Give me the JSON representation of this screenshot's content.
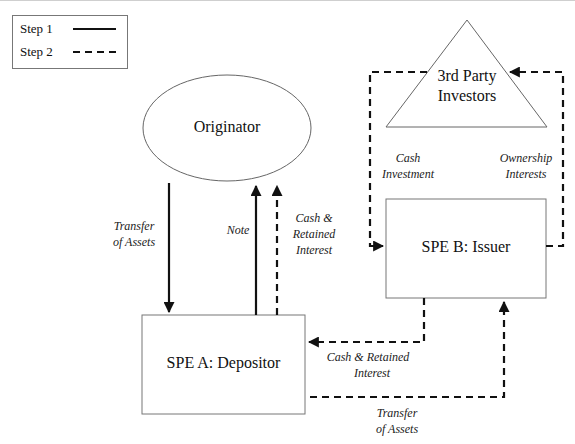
{
  "legend": {
    "items": [
      {
        "label": "Step 1",
        "style": "solid"
      },
      {
        "label": "Step 2",
        "style": "dashed"
      }
    ]
  },
  "nodes": {
    "originator": "Originator",
    "investors_line1": "3rd Party",
    "investors_line2": "Investors",
    "spe_a": "SPE A: Depositor",
    "spe_b": "SPE B: Issuer"
  },
  "flows": {
    "transfer_assets_1": {
      "line1": "Transfer",
      "line2": "of Assets",
      "step": 1
    },
    "note": {
      "line1": "Note",
      "step": 1
    },
    "cash_retained_1": {
      "line1": "Cash &",
      "line2": "Retained",
      "line3": "Interest",
      "step": 2
    },
    "cash_investment": {
      "line1": "Cash",
      "line2": "Investment",
      "step": 2
    },
    "ownership_interests": {
      "line1": "Ownership",
      "line2": "Interests",
      "step": 2
    },
    "cash_retained_2": {
      "line1": "Cash & Retained",
      "line2": "Interest",
      "step": 2
    },
    "transfer_assets_2": {
      "line1": "Transfer",
      "line2": "of Assets",
      "step": 2
    }
  },
  "colors": {
    "line": "#111111",
    "shape_border": "#777777",
    "background": "#ffffff"
  }
}
